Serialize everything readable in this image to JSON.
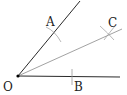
{
  "diagram": {
    "type": "angle-bisector-construction",
    "colors": {
      "ray": "#2a2a2a",
      "bisector": "#8a8a8a",
      "arc": "#9a9a9a",
      "point": "#000000",
      "label": "#222222"
    },
    "points": {
      "O": {
        "label": "O",
        "x": 18,
        "y": 76
      },
      "A": {
        "label": "A",
        "x": 52,
        "y": 30
      },
      "B": {
        "label": "B",
        "x": 72,
        "y": 77
      },
      "C": {
        "label": "C",
        "x": 108,
        "y": 33
      }
    },
    "labels": {
      "O": "O",
      "A": "A",
      "B": "B",
      "C": "C"
    }
  }
}
